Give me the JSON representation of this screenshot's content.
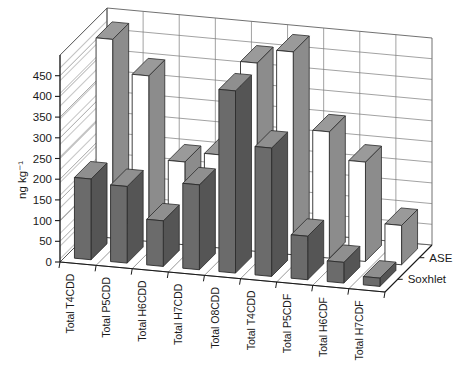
{
  "chart_data": {
    "type": "bar",
    "subtype": "3d-grouped-bar",
    "title": "",
    "xlabel": "",
    "ylabel": "ng kg⁻¹",
    "ylim": [
      0,
      500
    ],
    "ytick_step": 50,
    "yticks": [
      0,
      50,
      100,
      150,
      200,
      250,
      300,
      350,
      400,
      450
    ],
    "ytick_labels": [
      "0",
      "50",
      "100",
      "150",
      "200",
      "250",
      "300",
      "350",
      "400",
      "450"
    ],
    "grid": true,
    "legend_position": "right",
    "categories": [
      "Total T4CDD",
      "Total P5CDD",
      "Total H6CDD",
      "Total H7CDD",
      "Total O8CDD",
      "Total T4CDD",
      "Total P5CDF",
      "Total H6CDF",
      "Total H7CDF"
    ],
    "series": [
      {
        "name": "ASE",
        "row": "back",
        "color": "#ffffff",
        "top_color": "#9a9a9a",
        "side_color": "#8c8c8c",
        "values": [
          480,
          400,
          200,
          225,
          455,
          490,
          305,
          240,
          95
        ]
      },
      {
        "name": "Soxhlet",
        "row": "front",
        "color": "#6b6b6b",
        "top_color": "#8f8f8f",
        "side_color": "#555555",
        "values": [
          195,
          185,
          110,
          205,
          440,
          310,
          105,
          50,
          20
        ]
      }
    ],
    "legend": [
      "ASE",
      "Soxhlet"
    ]
  },
  "axis": {
    "y_label": "ng kg⁻¹"
  }
}
